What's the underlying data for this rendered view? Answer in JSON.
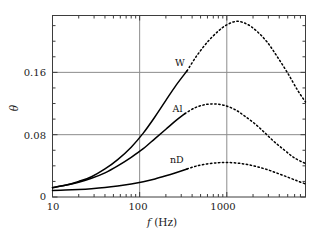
{
  "chart_data": {
    "type": "line",
    "title": "",
    "subtitle": "",
    "xlabel": "f (Hz)",
    "xlabel_italic_part": "f",
    "xlabel_rest": " (Hz)",
    "ylabel": "θ",
    "xscale": "log",
    "yscale": "linear",
    "xlim": [
      10,
      8000
    ],
    "ylim": [
      0,
      0.233
    ],
    "grid": true,
    "grid_color": "#8c8c8c",
    "legend_position": "inline-labels",
    "xticks": [
      10,
      100,
      1000
    ],
    "xtick_labels": [
      "10",
      "100",
      "1000"
    ],
    "yticks": [
      0,
      0.08,
      0.16
    ],
    "ytick_labels": [
      "0",
      "0.08",
      "0.16"
    ],
    "series": [
      {
        "name": "W",
        "label": "W",
        "label_x": 330,
        "label_y": 0.172,
        "style": "solid-then-dashed",
        "solid_end_x": 350,
        "x": [
          10,
          14,
          20,
          28,
          40,
          56,
          80,
          110,
          150,
          200,
          260,
          350,
          450,
          600,
          800,
          1000,
          1300,
          1700,
          2200,
          2900,
          3800,
          5000,
          6500,
          8000
        ],
        "y": [
          0.012,
          0.015,
          0.02,
          0.026,
          0.036,
          0.048,
          0.064,
          0.082,
          0.103,
          0.124,
          0.143,
          0.162,
          0.181,
          0.199,
          0.213,
          0.221,
          0.2255,
          0.222,
          0.213,
          0.199,
          0.18,
          0.159,
          0.137,
          0.122
        ]
      },
      {
        "name": "Al",
        "label": "Al",
        "label_x": 310,
        "label_y": 0.113,
        "style": "solid-then-dashed",
        "solid_end_x": 330,
        "x": [
          10,
          14,
          20,
          28,
          40,
          56,
          80,
          110,
          150,
          200,
          260,
          330,
          430,
          560,
          730,
          950,
          1250,
          1600,
          2100,
          2700,
          3500,
          4600,
          6000,
          8000
        ],
        "y": [
          0.012,
          0.015,
          0.019,
          0.024,
          0.031,
          0.04,
          0.051,
          0.062,
          0.075,
          0.087,
          0.098,
          0.107,
          0.1145,
          0.1185,
          0.1195,
          0.1175,
          0.112,
          0.104,
          0.094,
          0.083,
          0.071,
          0.06,
          0.05,
          0.043
        ]
      },
      {
        "name": "nD",
        "label": "nD",
        "label_x": 320,
        "label_y": 0.048,
        "style": "solid-then-dashed",
        "solid_end_x": 350,
        "x": [
          10,
          14,
          20,
          28,
          40,
          56,
          80,
          110,
          150,
          200,
          260,
          350,
          450,
          600,
          800,
          1000,
          1300,
          1700,
          2200,
          2900,
          3800,
          5000,
          6500,
          8000
        ],
        "y": [
          0.0085,
          0.009,
          0.0097,
          0.0107,
          0.0122,
          0.0142,
          0.0168,
          0.0196,
          0.0232,
          0.0272,
          0.0312,
          0.036,
          0.0398,
          0.0425,
          0.044,
          0.0443,
          0.0436,
          0.0418,
          0.039,
          0.0352,
          0.0305,
          0.0255,
          0.0205,
          0.0168
        ]
      }
    ]
  },
  "axes": {
    "y_tick_0": "0",
    "y_tick_008": "0.08",
    "y_tick_016": "0.16",
    "x_tick_10": "10",
    "x_tick_100": "100",
    "x_tick_1000": "1000",
    "y_axis_title": "θ",
    "x_axis_title_italic": "f",
    "x_axis_title_rest": "(Hz)"
  },
  "labels": {
    "series_w": "W",
    "series_al": "Al",
    "series_nd": "nD"
  }
}
